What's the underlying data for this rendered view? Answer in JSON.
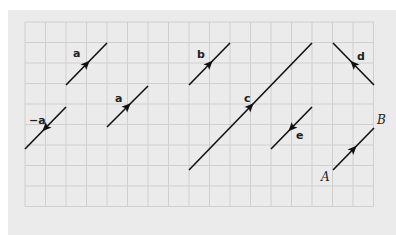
{
  "figure": {
    "background": "#ebebeb",
    "grid_color": "#cfcfcf",
    "line_color": "#111111",
    "grid": {
      "x0": 25,
      "y0": 22,
      "cols": 17,
      "rows": 9,
      "cell": 20.5
    },
    "vectors": [
      {
        "name": "a",
        "label": "a",
        "from": [
          66,
          85
        ],
        "to": [
          107,
          43
        ],
        "label_pos": [
          73,
          57
        ]
      },
      {
        "name": "a2",
        "label": "a",
        "from": [
          107,
          127
        ],
        "to": [
          148,
          86
        ],
        "label_pos": [
          115,
          102
        ]
      },
      {
        "name": "neg-a",
        "label": "−a",
        "from": [
          66,
          107
        ],
        "to": [
          25,
          149
        ],
        "label_pos": [
          29,
          124
        ]
      },
      {
        "name": "b",
        "label": "b",
        "from": [
          189,
          85
        ],
        "to": [
          230,
          43
        ],
        "label_pos": [
          197,
          58
        ]
      },
      {
        "name": "c",
        "label": "c",
        "from": [
          189,
          170
        ],
        "to": [
          312,
          43
        ],
        "label_pos": [
          244,
          102
        ]
      },
      {
        "name": "d",
        "label": "d",
        "from": [
          374,
          85
        ],
        "to": [
          333,
          43
        ],
        "label_pos": [
          357,
          60
        ]
      },
      {
        "name": "e",
        "label": "e",
        "from": [
          312,
          107
        ],
        "to": [
          271,
          149
        ],
        "label_pos": [
          296,
          139
        ]
      },
      {
        "name": "AB",
        "label": "",
        "from": [
          333,
          170
        ],
        "to": [
          374,
          128
        ],
        "label_pos": [
          0,
          0
        ]
      }
    ],
    "points": [
      {
        "name": "A",
        "label": "A",
        "pos": [
          321,
          181
        ]
      },
      {
        "name": "B",
        "label": "B",
        "pos": [
          377,
          124
        ]
      }
    ]
  }
}
